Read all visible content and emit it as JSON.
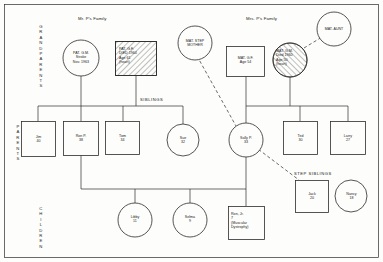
{
  "diagram": {
    "title_left": "Mr. P's Family",
    "title_right": "Mrs. P's Family",
    "section_siblings": "SIBLINGS",
    "section_step_siblings": "STEP SIBLINGS",
    "row_labels": {
      "grandparents": "GRANDPARENTS",
      "parents": "PARENTS",
      "children": "CHILDREN"
    },
    "colors": {
      "line": "#2b2b2b",
      "text": "#1a1a1a",
      "background": "#fdfdfb",
      "hatch": "#2b2b2b"
    }
  },
  "nodes": {
    "pat_gm": {
      "label": "PAT. G.M.\nStroke\nNov. 1963",
      "shape": "circle",
      "sex": "female",
      "deceased": false
    },
    "pat_gf": {
      "label": "PAT. G.F.\nDIED 1964\nAge 61\n(heart)",
      "shape": "square",
      "sex": "male",
      "deceased": true
    },
    "mat_step_mother": {
      "label": "MAT. STEP\nMOTHER",
      "shape": "circle",
      "sex": "female",
      "deceased": false
    },
    "mat_gf": {
      "label": "MAT. G.F.\nAge 54",
      "shape": "square",
      "sex": "male",
      "deceased": false
    },
    "mat_gm": {
      "label": "MAT. G.M.\nDied 1960\nAge 50\n(heart)",
      "shape": "circle",
      "sex": "female",
      "deceased": true
    },
    "mat_aunt": {
      "label": "MAT. AUNT",
      "shape": "circle",
      "sex": "female",
      "deceased": false
    },
    "jim": {
      "label": "Jim\n40",
      "shape": "square",
      "sex": "male"
    },
    "ron_p": {
      "label": "Ron P.\n38",
      "shape": "square",
      "sex": "male"
    },
    "tom": {
      "label": "Tom\n34",
      "shape": "square",
      "sex": "male"
    },
    "sue": {
      "label": "Sue\n32",
      "shape": "circle",
      "sex": "female"
    },
    "sally_p": {
      "label": "Sally P.\n33",
      "shape": "circle",
      "sex": "female"
    },
    "ted": {
      "label": "Ted\n30",
      "shape": "square",
      "sex": "male"
    },
    "larry": {
      "label": "Larry\n27",
      "shape": "square",
      "sex": "male"
    },
    "jack": {
      "label": "Jack\n20",
      "shape": "square",
      "sex": "male"
    },
    "nancy": {
      "label": "Nancy\n18",
      "shape": "circle",
      "sex": "female"
    },
    "libby": {
      "label": "Libby\n11",
      "shape": "circle",
      "sex": "female"
    },
    "selma": {
      "label": "Selma\n9",
      "shape": "circle",
      "sex": "female"
    },
    "ron_jr": {
      "label": "Ron, Jr.\n7\n(Muscular\nDystrophy)",
      "shape": "square",
      "sex": "male"
    }
  }
}
